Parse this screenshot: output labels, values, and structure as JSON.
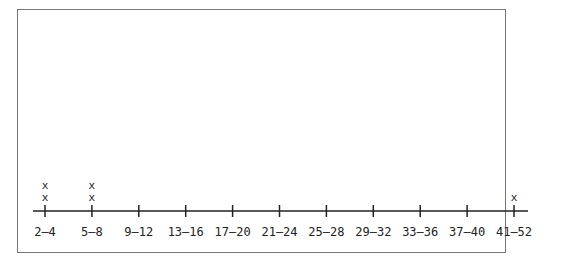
{
  "chart_data": {
    "type": "scatter",
    "subtype": "line-plot",
    "title": "",
    "xlabel": "",
    "ylabel": "",
    "categories": [
      "2–4",
      "5–8",
      "9–12",
      "13–16",
      "17–20",
      "21–24",
      "25–28",
      "29–32",
      "33–36",
      "37–40",
      "41–52"
    ],
    "values": [
      2,
      2,
      0,
      0,
      0,
      0,
      0,
      0,
      0,
      0,
      1
    ],
    "marker": "x",
    "grid": false,
    "legend": null
  }
}
